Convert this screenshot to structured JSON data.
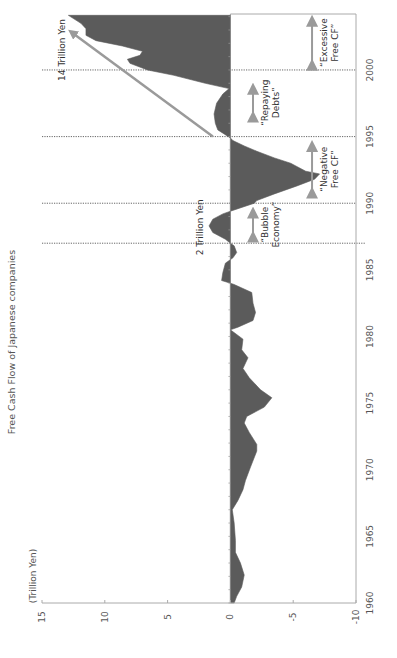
{
  "chart_data": {
    "type": "area",
    "orientation": "rotated-90-ccw",
    "title": "Free Cash Flow of Japanese companies",
    "ylabel": "(Trillion Yen)",
    "xlabel": "",
    "xlim": [
      1960,
      2004.2
    ],
    "ylim": [
      -10,
      15
    ],
    "x_ticks": [
      1960,
      1965,
      1970,
      1975,
      1980,
      1985,
      1990,
      1995,
      2000
    ],
    "x_tick_labels": [
      "1960",
      "1965",
      "1970",
      "1975",
      "1980",
      "1985",
      "1990",
      "1995",
      "2000"
    ],
    "y_ticks": [
      15,
      10,
      5,
      0,
      -5,
      -10
    ],
    "y_tick_labels": [
      "15",
      "10",
      "5",
      "0",
      "-5",
      "-10"
    ],
    "grid": false,
    "legend": null,
    "fill_color": "#5b5b5b",
    "axis_color": "#aaaaaa",
    "annotation_color": "#9a9a9a",
    "series": [
      {
        "name": "Free Cash Flow",
        "x": [
          1960.0,
          1960.5,
          1961.2,
          1962.1,
          1963.0,
          1963.8,
          1964.7,
          1966.0,
          1967.0,
          1967.7,
          1968.5,
          1969.2,
          1970.2,
          1971.4,
          1971.9,
          1972.8,
          1973.5,
          1974.0,
          1974.7,
          1975.4,
          1976.0,
          1976.9,
          1977.6,
          1978.4,
          1979.0,
          1979.8,
          1980.5,
          1980.7,
          1981.2,
          1981.8,
          1982.5,
          1983.3,
          1983.9,
          1984.0,
          1984.2,
          1984.8,
          1985.5,
          1985.9,
          1986.3,
          1986.8,
          1987.0,
          1987.3,
          1987.8,
          1988.3,
          1988.8,
          1989.2,
          1989.4,
          1990.0,
          1990.2,
          1990.7,
          1991.3,
          1991.8,
          1992.2,
          1992.4,
          1993.0,
          1993.4,
          1993.9,
          1994.3,
          1994.7,
          1994.9,
          1995.5,
          1996.0,
          1996.7,
          1997.5,
          1998.2,
          1998.6,
          1999.0,
          1999.6,
          2000.0,
          2000.5,
          2000.8,
          2001.1,
          2001.4,
          2001.8,
          2002.2,
          2002.6,
          2003.1,
          2003.5,
          2004.1
        ],
        "values": [
          -0.3,
          -0.5,
          -0.9,
          -1.1,
          -0.8,
          -0.4,
          -0.4,
          -0.3,
          -0.15,
          -0.6,
          -1.0,
          -1.2,
          -1.6,
          -2.1,
          -2.1,
          -1.5,
          -1.1,
          -1.3,
          -2.7,
          -3.3,
          -2.4,
          -1.5,
          -1.0,
          -1.4,
          -0.9,
          -1.0,
          0.0,
          -0.6,
          -1.8,
          -2.0,
          -1.8,
          -1.7,
          -0.3,
          0.0,
          0.7,
          0.6,
          0.4,
          -0.2,
          -0.5,
          -0.3,
          0.0,
          0.4,
          1.4,
          1.7,
          1.4,
          0.6,
          0.0,
          -1.9,
          -2.1,
          -3.5,
          -5.3,
          -6.7,
          -7.1,
          -6.0,
          -4.8,
          -3.5,
          -2.1,
          -1.1,
          -0.2,
          0.0,
          1.0,
          1.2,
          1.3,
          1.1,
          0.6,
          0.1,
          2.0,
          4.5,
          6.6,
          8.0,
          8.2,
          7.2,
          7.0,
          8.6,
          10.7,
          11.5,
          11.5,
          11.9,
          12.9
        ]
      }
    ],
    "reference_lines": [
      {
        "x": 1987
      },
      {
        "x": 1990
      },
      {
        "x": 1995
      },
      {
        "x": 2000
      }
    ],
    "annotations": [
      {
        "text": "2 Trillion Yen",
        "x": 1988.2,
        "y": 2.4,
        "type": "label"
      },
      {
        "text": "14 Trillion Yen",
        "x": 2001.5,
        "y": 13.4,
        "type": "label"
      },
      {
        "text": "“Bubble Economy”",
        "x_range": [
          1987.2,
          1989.6
        ],
        "y": -1.8,
        "type": "period"
      },
      {
        "text": "“Negative Free CF”",
        "x_range": [
          1990.5,
          1994.6
        ],
        "y": -6.5,
        "type": "period"
      },
      {
        "text": "“Repaying Debts”",
        "x_range": [
          1996.2,
          1998.9
        ],
        "y": -1.8,
        "type": "period"
      },
      {
        "text": "“Excessive Free CF”",
        "x_range": [
          2000.1,
          2004.0
        ],
        "y": -6.5,
        "type": "period"
      }
    ],
    "trend_arrow": {
      "from": {
        "x": 1995.0,
        "y": 1.4
      },
      "to": {
        "x": 2002.8,
        "y": 12.6
      }
    }
  }
}
